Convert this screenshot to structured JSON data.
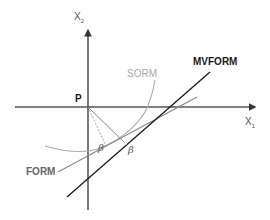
{
  "diagram": {
    "type": "reliability-method-comparison",
    "axes": {
      "x": {
        "label": "X",
        "subscript": "1"
      },
      "y": {
        "label": "X",
        "subscript": "2"
      }
    },
    "origin_label": "P",
    "curves": [
      {
        "name": "MVFORM",
        "label": "MVFORM",
        "style": "solid",
        "color": "#1a1a1a"
      },
      {
        "name": "FORM",
        "label": "FORM",
        "style": "solid",
        "color": "#888888"
      },
      {
        "name": "SORM",
        "label": "SORM",
        "style": "solid",
        "color": "#aaaaaa"
      }
    ],
    "distances": [
      {
        "label": "β",
        "to": "FORM"
      },
      {
        "label": "β",
        "to": "MVFORM"
      }
    ],
    "colors": {
      "axis": "#333333",
      "mvform": "#1a1a1a",
      "form": "#888888",
      "sorm": "#aaaaaa",
      "label_dark": "#1a1a1a",
      "label_gray": "#666666",
      "label_light": "#a8a8a8"
    }
  }
}
